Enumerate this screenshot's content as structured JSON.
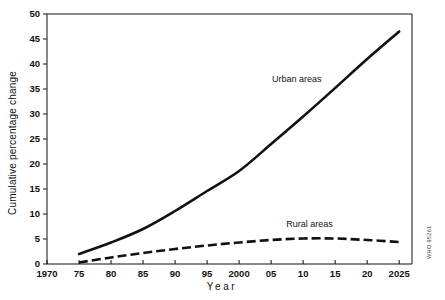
{
  "chart_data": {
    "type": "line",
    "title": "",
    "xlabel": "Year",
    "ylabel": "Cumulative percentage change",
    "xlim": [
      1970,
      2027
    ],
    "ylim": [
      0,
      50
    ],
    "grid": false,
    "legend_position": "inline-annotations",
    "x_tick_values": [
      1970,
      1975,
      1980,
      1985,
      1990,
      1995,
      2000,
      2005,
      2010,
      2015,
      2020,
      2025
    ],
    "x_tick_labels": [
      "1970",
      "75",
      "80",
      "85",
      "90",
      "95",
      "2000",
      "05",
      "10",
      "15",
      "20",
      "2025"
    ],
    "y_tick_values": [
      0,
      5,
      10,
      15,
      20,
      25,
      30,
      35,
      40,
      45,
      50
    ],
    "y_tick_labels": [
      "0",
      "5",
      "10",
      "15",
      "20",
      "25",
      "30",
      "35",
      "40",
      "45",
      "50"
    ],
    "x": [
      1975,
      1980,
      1985,
      1990,
      1995,
      2000,
      2005,
      2010,
      2015,
      2020,
      2025
    ],
    "series": [
      {
        "name": "Urban areas",
        "label": "Urban areas",
        "style": "solid",
        "color": "#111111",
        "values": [
          2.0,
          4.3,
          7.0,
          10.6,
          14.6,
          18.6,
          24.0,
          29.5,
          35.2,
          41.0,
          46.5
        ],
        "label_x": 2009,
        "label_y": 36.5
      },
      {
        "name": "Rural areas",
        "label": "Rural areas",
        "style": "dashed",
        "color": "#111111",
        "values": [
          0.3,
          1.3,
          2.2,
          3.0,
          3.7,
          4.3,
          4.8,
          5.1,
          5.1,
          4.8,
          4.4
        ],
        "label_x": 2011,
        "label_y": 7.4
      }
    ],
    "annotations": [
      {
        "name": "source-code",
        "text": "WHO 95261",
        "orientation": "vertical"
      }
    ]
  }
}
